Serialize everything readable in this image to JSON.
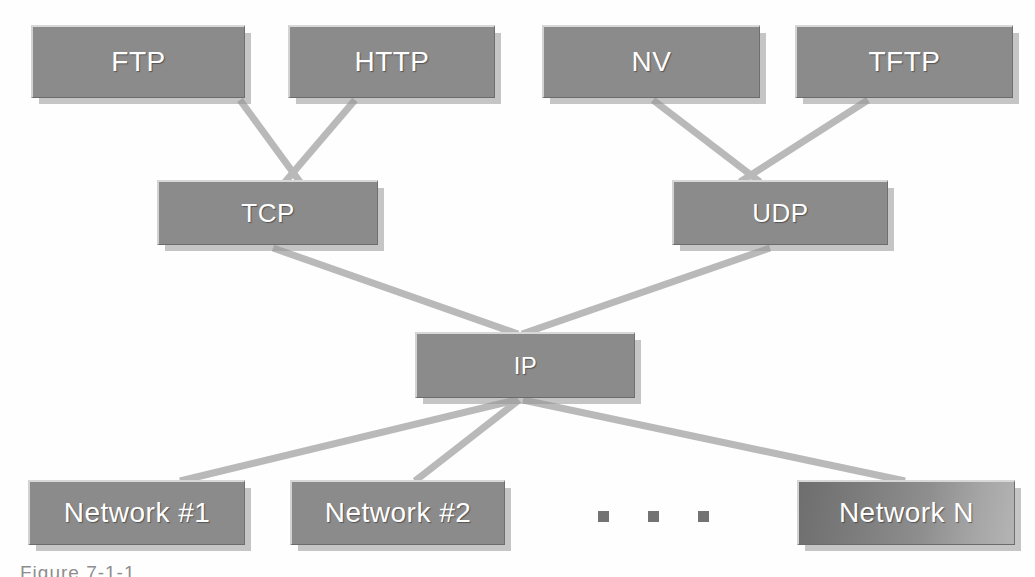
{
  "diagram": {
    "background_color": "#fefefe",
    "box_fill_color": "#8b8b8b",
    "box_text_color": "#ffffff",
    "connector_color": "#b9b9b9",
    "shadow_color": "#9c9c9c",
    "dot_color": "#737373"
  },
  "layers": {
    "application": {
      "name": "Application protocols",
      "nodes": [
        {
          "id": "ftp",
          "label": "FTP",
          "x": 31,
          "y": 25,
          "w": 214,
          "h": 73,
          "font_size": 28
        },
        {
          "id": "http",
          "label": "HTTP",
          "x": 288,
          "y": 25,
          "w": 207,
          "h": 73,
          "font_size": 28
        },
        {
          "id": "nv",
          "label": "NV",
          "x": 542,
          "y": 25,
          "w": 218,
          "h": 73,
          "font_size": 28
        },
        {
          "id": "tftp",
          "label": "TFTP",
          "x": 795,
          "y": 25,
          "w": 218,
          "h": 73,
          "font_size": 28
        }
      ]
    },
    "transport": {
      "name": "Transport protocols",
      "nodes": [
        {
          "id": "tcp",
          "label": "TCP",
          "x": 157,
          "y": 180,
          "w": 221,
          "h": 65,
          "font_size": 26
        },
        {
          "id": "udp",
          "label": "UDP",
          "x": 672,
          "y": 180,
          "w": 216,
          "h": 65,
          "font_size": 26
        }
      ]
    },
    "internet": {
      "name": "Internet protocol",
      "nodes": [
        {
          "id": "ip",
          "label": "IP",
          "x": 415,
          "y": 332,
          "w": 220,
          "h": 66,
          "font_size": 24
        }
      ]
    },
    "network": {
      "name": "Physical networks",
      "nodes": [
        {
          "id": "net1",
          "label": "Network #1",
          "x": 28,
          "y": 480,
          "w": 217,
          "h": 65,
          "font_size": 28,
          "gradient": false
        },
        {
          "id": "net2",
          "label": "Network #2",
          "x": 290,
          "y": 480,
          "w": 215,
          "h": 65,
          "font_size": 28,
          "gradient": false
        },
        {
          "id": "netn",
          "label": "Network N",
          "x": 797,
          "y": 480,
          "w": 218,
          "h": 65,
          "font_size": 28,
          "gradient": true
        }
      ]
    }
  },
  "ellipsis": {
    "label": "more networks",
    "dot_count": 3,
    "x": 598,
    "y": 511,
    "dot_size": 11
  },
  "connections": [
    {
      "from": "ftp",
      "to": "tcp",
      "x1": 240,
      "y1": 100,
      "x2": 300,
      "y2": 182
    },
    {
      "from": "http",
      "to": "tcp",
      "x1": 355,
      "y1": 100,
      "x2": 285,
      "y2": 182
    },
    {
      "from": "nv",
      "to": "udp",
      "x1": 653,
      "y1": 100,
      "x2": 760,
      "y2": 182
    },
    {
      "from": "tftp",
      "to": "udp",
      "x1": 868,
      "y1": 100,
      "x2": 740,
      "y2": 182
    },
    {
      "from": "tcp",
      "to": "ip",
      "x1": 273,
      "y1": 248,
      "x2": 518,
      "y2": 334
    },
    {
      "from": "udp",
      "to": "ip",
      "x1": 770,
      "y1": 248,
      "x2": 522,
      "y2": 334
    },
    {
      "from": "ip",
      "to": "net1",
      "x1": 516,
      "y1": 400,
      "x2": 180,
      "y2": 481
    },
    {
      "from": "ip",
      "to": "net2",
      "x1": 519,
      "y1": 400,
      "x2": 415,
      "y2": 481
    },
    {
      "from": "ip",
      "to": "netn",
      "x1": 523,
      "y1": 400,
      "x2": 905,
      "y2": 481
    }
  ],
  "caption": {
    "text": "Figure 7-1-1"
  }
}
